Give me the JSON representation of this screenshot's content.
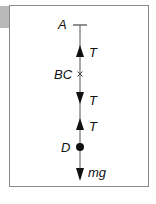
{
  "diagram": {
    "points": [
      {
        "label": "A",
        "y": 25
      },
      {
        "label": "BC",
        "y": 74
      },
      {
        "label": "D",
        "y": 147
      }
    ],
    "forces": [
      {
        "label": "T",
        "direction": "up",
        "at": "above BC"
      },
      {
        "label": "T",
        "direction": "down",
        "at": "below BC"
      },
      {
        "label": "T",
        "direction": "up",
        "at": "above D"
      },
      {
        "label": "mg",
        "direction": "down",
        "at": "D"
      }
    ],
    "labels": {
      "a": "A",
      "bc": "BC",
      "d": "D",
      "t1": "T",
      "t2": "T",
      "t3": "T",
      "mg": "mg"
    },
    "colors": {
      "line": "#222222",
      "frame": "#8a8a8a",
      "tab": "#b9b9b9"
    }
  }
}
